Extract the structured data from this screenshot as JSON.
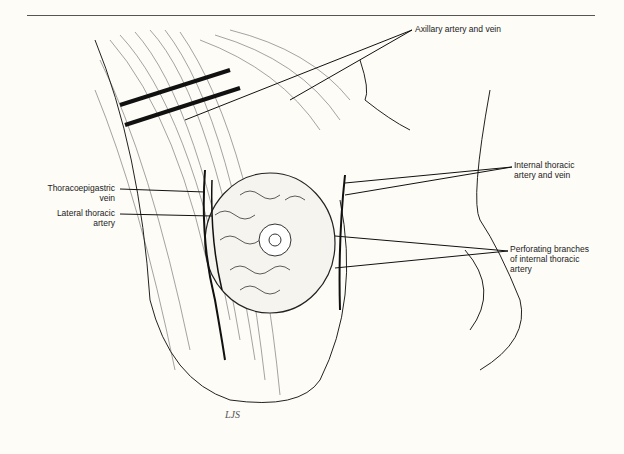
{
  "figure": {
    "labels": {
      "axillary": "Axillary artery and vein",
      "internal_thoracic_1": "Internal thoracic",
      "internal_thoracic_2": "artery and vein",
      "thoracoepigastric_1": "Thoracoepigastric",
      "thoracoepigastric_2": "vein",
      "lateral_thoracic_1": "Lateral thoracic",
      "lateral_thoracic_2": "artery",
      "perforating_1": "Perforating branches",
      "perforating_2": "of internal thoracic",
      "perforating_3": "artery"
    },
    "signature": "LJS"
  }
}
